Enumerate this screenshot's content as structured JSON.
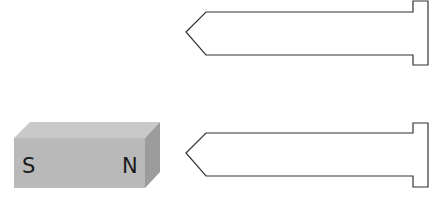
{
  "magnet": {
    "south_label": "S",
    "north_label": "N",
    "colors": {
      "front": "#b9b9b9",
      "top": "#c9c9c9",
      "side": "#9c9c9c"
    }
  },
  "nails": [
    {
      "id": "nail-top"
    },
    {
      "id": "nail-bottom"
    }
  ],
  "colors": {
    "outline": "#333333",
    "background": "#ffffff"
  }
}
